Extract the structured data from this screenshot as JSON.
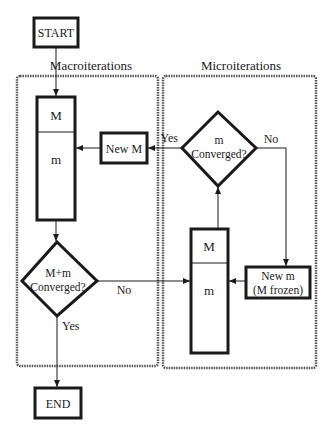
{
  "diagram": {
    "type": "flowchart",
    "colors": {
      "ink": "#1a1a1a",
      "dashed_border": "#555555",
      "background": "#ffffff"
    },
    "regions": {
      "macro": {
        "title": "Macroiterations"
      },
      "micro": {
        "title": "Microiterations"
      }
    },
    "nodes": {
      "start": {
        "label": "START"
      },
      "end": {
        "label": "END"
      },
      "macro_state": {
        "top": "M",
        "bottom": "m"
      },
      "new_M": {
        "label": "New M"
      },
      "macro_decision": {
        "line1": "M+m",
        "line2": "Converged?"
      },
      "micro_state": {
        "top": "M",
        "bottom": "m"
      },
      "micro_decision": {
        "line1": "m",
        "line2": "Converged?"
      },
      "new_m": {
        "line1": "New m",
        "line2": "(M frozen)"
      }
    },
    "edges": {
      "macro_no": "No",
      "macro_yes": "Yes",
      "micro_yes": "Yes",
      "micro_no": "No"
    }
  }
}
